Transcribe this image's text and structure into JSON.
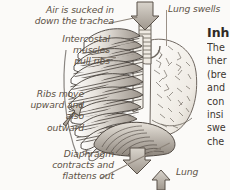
{
  "page": {
    "background_color": "#fbfaf8",
    "label_color": "#5d5246",
    "heading_color": "#2f2a26"
  },
  "annotations": {
    "trachea": "Air is sucked in\ndown the trachea",
    "intercostal": "Intercostal\nmuscles\npull ribs",
    "ribs": "Ribs move\nupward and\nalso\noutward",
    "diaphragm": "Diaphragm\ncontracts and\nflattens out",
    "lung_swells": "Lung swells",
    "lung_bottom": "Lung"
  },
  "body_copy": {
    "heading": "Inh",
    "lines": [
      "The",
      "ther",
      "(bre",
      "and",
      "con",
      "insi",
      "swe",
      "che"
    ]
  },
  "illustration": {
    "parts": [
      "ribcage",
      "trachea",
      "lung",
      "diaphragm",
      "sternum"
    ],
    "arrows": [
      {
        "name": "air-in-arrow",
        "direction": "down"
      },
      {
        "name": "ribs-outward-arrow",
        "direction": "up"
      },
      {
        "name": "diaphragm-down-arrow",
        "direction": "down"
      },
      {
        "name": "lung-up-arrow",
        "direction": "up"
      }
    ]
  }
}
